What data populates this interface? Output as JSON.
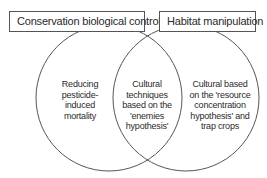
{
  "diagram": {
    "type": "venn",
    "sets": [
      {
        "label": "Conservation biological control",
        "region_text": "Reducing pesticide-induced mortality"
      },
      {
        "label": "Habitat manipulation",
        "region_text": "Cultural based on the 'resource concentration hypothesis' and trap crops"
      }
    ],
    "intersection_text": "Cultural techniques based on the 'enemies hypothesis'"
  },
  "left_lines": [
    "Reducing",
    "pesticide-",
    "induced",
    "mortality"
  ],
  "center_lines": [
    "Cultural",
    "techniques",
    "based on the",
    "'enemies",
    "hypothesis'"
  ],
  "right_lines": [
    "Cultural based",
    "on the 'resource",
    "concentration",
    "hypothesis' and",
    "trap crops"
  ],
  "colors": {
    "stroke": "#555555",
    "text": "#2a2a2a",
    "background": "#ffffff"
  }
}
